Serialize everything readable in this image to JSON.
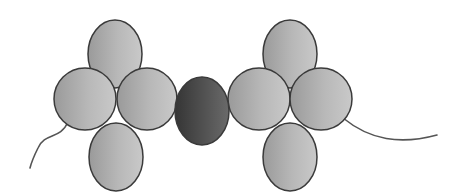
{
  "diagram": {
    "title": "",
    "colors": {
      "background": "#ffffff",
      "bead_light": "#c4c4c4",
      "bead_mid": "#a4a4a4",
      "bead_outline": "#3a3a3a",
      "center_bead_light": "#6a6a6a",
      "center_bead_dark": "#3c3c3c",
      "wire": "#555555"
    },
    "left_cluster": [
      {
        "name": "top",
        "cx": 115,
        "cy": 54,
        "rx": 27,
        "ry": 34
      },
      {
        "name": "left",
        "cx": 85,
        "cy": 99,
        "rx": 31,
        "ry": 31
      },
      {
        "name": "right",
        "cx": 147,
        "cy": 99,
        "rx": 30,
        "ry": 31
      },
      {
        "name": "bottom",
        "cx": 116,
        "cy": 157,
        "rx": 27,
        "ry": 34
      }
    ],
    "center_bead": {
      "cx": 202,
      "cy": 111,
      "rx": 27,
      "ry": 34
    },
    "right_cluster": [
      {
        "name": "top",
        "cx": 290,
        "cy": 54,
        "rx": 27,
        "ry": 34
      },
      {
        "name": "left",
        "cx": 259,
        "cy": 99,
        "rx": 31,
        "ry": 31
      },
      {
        "name": "right",
        "cx": 321,
        "cy": 99,
        "rx": 31,
        "ry": 31
      },
      {
        "name": "bottom",
        "cx": 290,
        "cy": 157,
        "rx": 27,
        "ry": 34
      }
    ],
    "wires": {
      "left": "M68,122 C60,140 45,132 38,148 C33,158 31,164 30,168",
      "right": "M343,118 C370,140 400,145 437,135"
    }
  }
}
